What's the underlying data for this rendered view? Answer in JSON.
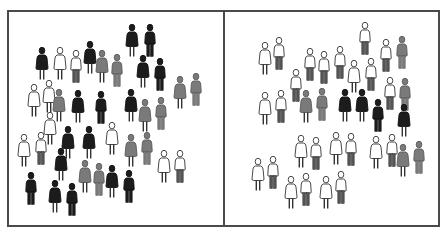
{
  "figure": {
    "title": "Two groups of people: left group mixed black, gray and white figures; right group mostly white figures",
    "colors": {
      "black": "#1c1c1c",
      "gray": "#7a7a7a",
      "white": "#ffffff",
      "outline": "#333333",
      "border": "#4a4a4a"
    },
    "panels": [
      {
        "name": "left",
        "label": "Left group",
        "figures": [
          {
            "x": 42,
            "y": 47,
            "style": "dress",
            "color": "black"
          },
          {
            "x": 60,
            "y": 47,
            "style": "dress",
            "color": "white"
          },
          {
            "x": 76,
            "y": 50,
            "style": "pants",
            "color": "white"
          },
          {
            "x": 90,
            "y": 41,
            "style": "dress",
            "color": "black"
          },
          {
            "x": 102,
            "y": 50,
            "style": "dress",
            "color": "gray"
          },
          {
            "x": 117,
            "y": 54,
            "style": "pants",
            "color": "gray"
          },
          {
            "x": 132,
            "y": 24,
            "style": "dress",
            "color": "black"
          },
          {
            "x": 150,
            "y": 24,
            "style": "pants",
            "color": "black"
          },
          {
            "x": 143,
            "y": 55,
            "style": "dress",
            "color": "black"
          },
          {
            "x": 160,
            "y": 58,
            "style": "pants",
            "color": "black"
          },
          {
            "x": 34,
            "y": 84,
            "style": "dress",
            "color": "white"
          },
          {
            "x": 49,
            "y": 80,
            "style": "dress",
            "color": "white"
          },
          {
            "x": 59,
            "y": 89,
            "style": "dress",
            "color": "gray"
          },
          {
            "x": 78,
            "y": 90,
            "style": "dress",
            "color": "black"
          },
          {
            "x": 101,
            "y": 91,
            "style": "pants",
            "color": "black"
          },
          {
            "x": 131,
            "y": 89,
            "style": "dress",
            "color": "black"
          },
          {
            "x": 145,
            "y": 99,
            "style": "dress",
            "color": "gray"
          },
          {
            "x": 161,
            "y": 97,
            "style": "pants",
            "color": "gray"
          },
          {
            "x": 180,
            "y": 76,
            "style": "dress",
            "color": "gray"
          },
          {
            "x": 196,
            "y": 73,
            "style": "pants",
            "color": "gray"
          },
          {
            "x": 50,
            "y": 112,
            "style": "dress",
            "color": "white"
          },
          {
            "x": 24,
            "y": 134,
            "style": "dress",
            "color": "white"
          },
          {
            "x": 41,
            "y": 132,
            "style": "pants",
            "color": "white"
          },
          {
            "x": 68,
            "y": 126,
            "style": "dress",
            "color": "black"
          },
          {
            "x": 89,
            "y": 126,
            "style": "dress",
            "color": "black"
          },
          {
            "x": 112,
            "y": 122,
            "style": "dress",
            "color": "white"
          },
          {
            "x": 131,
            "y": 134,
            "style": "dress",
            "color": "gray"
          },
          {
            "x": 147,
            "y": 132,
            "style": "pants",
            "color": "gray"
          },
          {
            "x": 61,
            "y": 148,
            "style": "dress",
            "color": "black"
          },
          {
            "x": 164,
            "y": 150,
            "style": "dress",
            "color": "white"
          },
          {
            "x": 180,
            "y": 150,
            "style": "pants",
            "color": "white"
          },
          {
            "x": 85,
            "y": 160,
            "style": "dress",
            "color": "gray"
          },
          {
            "x": 99,
            "y": 163,
            "style": "pants",
            "color": "gray"
          },
          {
            "x": 112,
            "y": 165,
            "style": "dress",
            "color": "black"
          },
          {
            "x": 129,
            "y": 170,
            "style": "pants",
            "color": "black"
          },
          {
            "x": 31,
            "y": 172,
            "style": "pants",
            "color": "black"
          },
          {
            "x": 55,
            "y": 180,
            "style": "dress",
            "color": "black"
          },
          {
            "x": 72,
            "y": 183,
            "style": "pants",
            "color": "black"
          }
        ]
      },
      {
        "name": "right",
        "label": "Right group",
        "figures": [
          {
            "x": 265,
            "y": 42,
            "style": "dress",
            "color": "white"
          },
          {
            "x": 279,
            "y": 37,
            "style": "pants",
            "color": "white"
          },
          {
            "x": 365,
            "y": 22,
            "style": "pants",
            "color": "white"
          },
          {
            "x": 310,
            "y": 48,
            "style": "pants",
            "color": "white"
          },
          {
            "x": 324,
            "y": 51,
            "style": "pants",
            "color": "white"
          },
          {
            "x": 340,
            "y": 46,
            "style": "pants",
            "color": "white"
          },
          {
            "x": 354,
            "y": 60,
            "style": "dress",
            "color": "white"
          },
          {
            "x": 371,
            "y": 58,
            "style": "pants",
            "color": "white"
          },
          {
            "x": 386,
            "y": 39,
            "style": "pants",
            "color": "white"
          },
          {
            "x": 402,
            "y": 36,
            "style": "pants",
            "color": "gray"
          },
          {
            "x": 296,
            "y": 69,
            "style": "pants",
            "color": "white"
          },
          {
            "x": 265,
            "y": 92,
            "style": "dress",
            "color": "white"
          },
          {
            "x": 281,
            "y": 90,
            "style": "pants",
            "color": "white"
          },
          {
            "x": 306,
            "y": 90,
            "style": "dress",
            "color": "gray"
          },
          {
            "x": 322,
            "y": 88,
            "style": "pants",
            "color": "gray"
          },
          {
            "x": 345,
            "y": 89,
            "style": "dress",
            "color": "black"
          },
          {
            "x": 362,
            "y": 89,
            "style": "dress",
            "color": "black"
          },
          {
            "x": 378,
            "y": 99,
            "style": "pants",
            "color": "black"
          },
          {
            "x": 390,
            "y": 77,
            "style": "pants",
            "color": "white"
          },
          {
            "x": 405,
            "y": 78,
            "style": "pants",
            "color": "gray"
          },
          {
            "x": 404,
            "y": 104,
            "style": "dress",
            "color": "black"
          },
          {
            "x": 301,
            "y": 135,
            "style": "dress",
            "color": "white"
          },
          {
            "x": 316,
            "y": 137,
            "style": "pants",
            "color": "white"
          },
          {
            "x": 336,
            "y": 132,
            "style": "dress",
            "color": "white"
          },
          {
            "x": 351,
            "y": 133,
            "style": "pants",
            "color": "white"
          },
          {
            "x": 376,
            "y": 136,
            "style": "dress",
            "color": "white"
          },
          {
            "x": 392,
            "y": 134,
            "style": "pants",
            "color": "white"
          },
          {
            "x": 403,
            "y": 144,
            "style": "dress",
            "color": "gray"
          },
          {
            "x": 419,
            "y": 141,
            "style": "pants",
            "color": "gray"
          },
          {
            "x": 258,
            "y": 158,
            "style": "dress",
            "color": "white"
          },
          {
            "x": 273,
            "y": 156,
            "style": "pants",
            "color": "white"
          },
          {
            "x": 291,
            "y": 176,
            "style": "dress",
            "color": "white"
          },
          {
            "x": 306,
            "y": 173,
            "style": "pants",
            "color": "white"
          },
          {
            "x": 326,
            "y": 176,
            "style": "dress",
            "color": "white"
          },
          {
            "x": 341,
            "y": 171,
            "style": "pants",
            "color": "white"
          }
        ]
      }
    ]
  }
}
